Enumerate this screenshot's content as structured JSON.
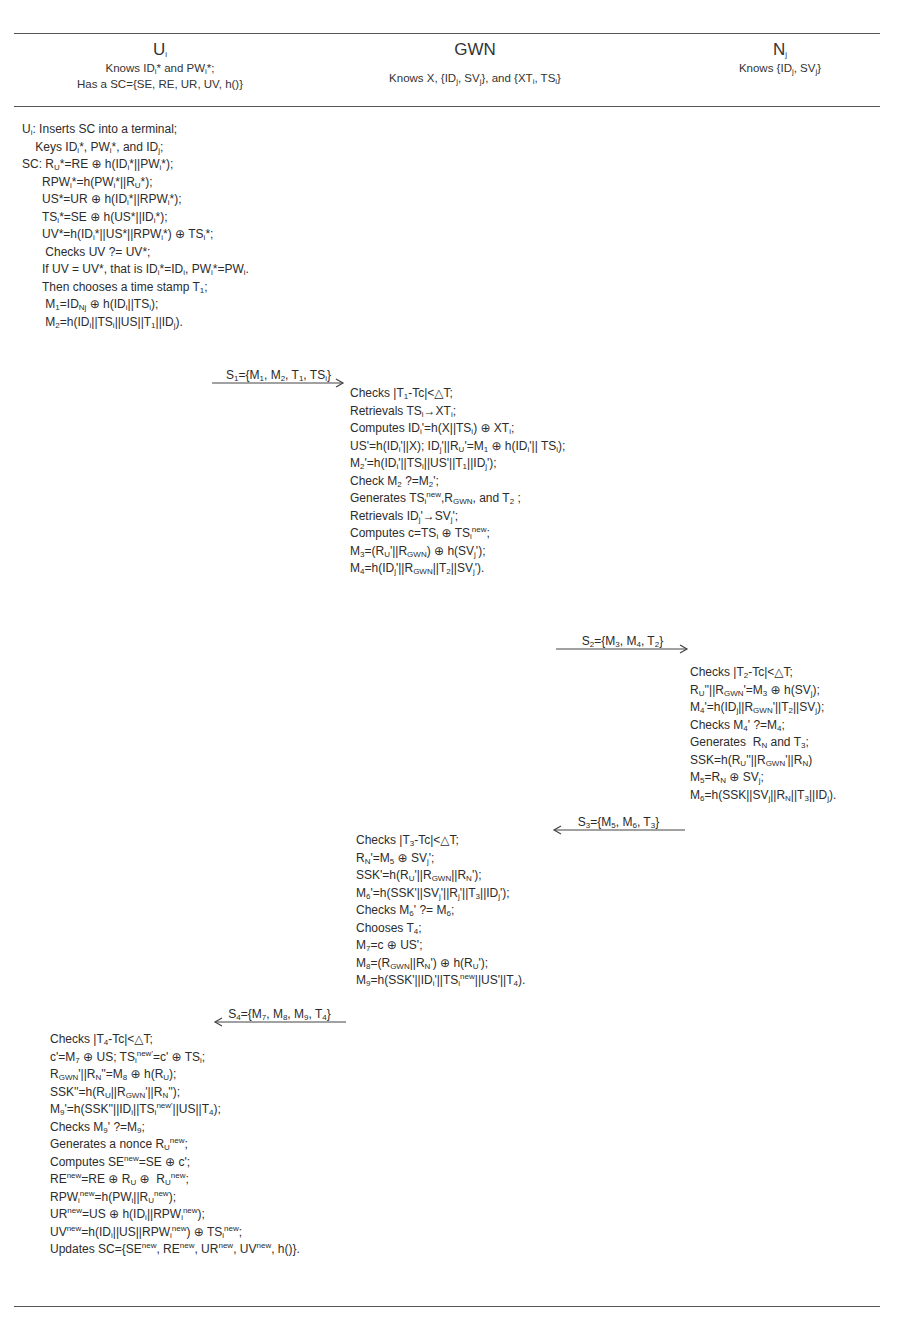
{
  "parties": {
    "user": {
      "name": "U",
      "name_sub": "i",
      "knows_html": "Knows ID<sub>i</sub>* and PW<sub>i</sub>*;",
      "has_html": "Has a SC={SE, RE, UR, UV, h()}"
    },
    "gwn": {
      "name": "GWN",
      "knows_html": "Knows X, {ID<sub>j</sub>, SV<sub>j</sub>}, and {XT<sub>i</sub>, TS<sub>i</sub>}"
    },
    "node": {
      "name": "N",
      "name_sub": "j",
      "knows_html": "Knows {ID<sub>j</sub>, SV<sub>j</sub>}"
    }
  },
  "user_login_steps": [
    "U<sub>i</sub>: Inserts SC into a terminal;",
    "&nbsp;&nbsp;&nbsp;&nbsp;Keys ID<sub>i</sub>*, PW<sub>i</sub>*, and ID<sub>j</sub>;",
    "SC: R<sub>U</sub>*=RE &#8853; h(ID<sub>i</sub>*||PW<sub>i</sub>*);",
    "&nbsp;&nbsp;&nbsp;&nbsp;&nbsp;&nbsp;RPW<sub>i</sub>*=h(PW<sub>i</sub>*||R<sub>U</sub>*);",
    "&nbsp;&nbsp;&nbsp;&nbsp;&nbsp;&nbsp;US*=UR &#8853; h(ID<sub>i</sub>*||RPW<sub>i</sub>*);",
    "&nbsp;&nbsp;&nbsp;&nbsp;&nbsp;&nbsp;TS<sub>i</sub>*=SE &#8853; h(US*||ID<sub>i</sub>*);",
    "&nbsp;&nbsp;&nbsp;&nbsp;&nbsp;&nbsp;UV*=h(ID<sub>i</sub>*||US*||RPW<sub>i</sub>*) &#8853; TS<sub>i</sub>*;",
    "&nbsp;&nbsp;&nbsp;&nbsp;&nbsp;&nbsp;&nbsp;Checks UV ?= UV*;",
    "&nbsp;&nbsp;&nbsp;&nbsp;&nbsp;&nbsp;If UV = UV*, that is ID<sub>i</sub>*=ID<sub>i</sub>, PW<sub>i</sub>*=PW<sub>i</sub>.",
    "&nbsp;&nbsp;&nbsp;&nbsp;&nbsp;&nbsp;Then chooses a time stamp T<sub>1</sub>;",
    "&nbsp;&nbsp;&nbsp;&nbsp;&nbsp;&nbsp;&nbsp;M<sub>1</sub>=ID<sub>Nj</sub> &#8853; h(ID<sub>i</sub>||TS<sub>i</sub>);",
    "&nbsp;&nbsp;&nbsp;&nbsp;&nbsp;&nbsp;&nbsp;M<sub>2</sub>=h(ID<sub>i</sub>||TS<sub>i</sub>||US||T<sub>1</sub>||ID<sub>j</sub>)."
  ],
  "messages": {
    "s1": {
      "label_html": "S<sub>1</sub>={M<sub>1</sub>, M<sub>2</sub>, T<sub>1</sub>, TS<sub>i</sub>}",
      "direction": "right"
    },
    "s2": {
      "label_html": "S<sub>2</sub>={M<sub>3</sub>, M<sub>4</sub>, T<sub>2</sub>}",
      "direction": "right"
    },
    "s3": {
      "label_html": "S<sub>3</sub>={M<sub>5</sub>, M<sub>6</sub>, T<sub>3</sub>}",
      "direction": "left"
    },
    "s4": {
      "label_html": "S<sub>4</sub>={M<sub>7</sub>, M<sub>8</sub>, M<sub>9</sub>, T<sub>4</sub>}",
      "direction": "left"
    }
  },
  "gwn_steps_1": [
    "Checks |T<sub>1</sub>-Tc|&lt;&#9651;T;",
    "Retrievals TS<sub>i</sub>&#8594;XT<sub>i</sub>;",
    "Computes ID<sub>i</sub>'=h(X||TS<sub>i</sub>) &#8853; XT<sub>i</sub>;",
    "US'=h(ID<sub>i</sub>'||X); ID<sub>j</sub>'||R<sub>U</sub>'=M<sub>1</sub> &#8853; h(ID<sub>i</sub>'|| TS<sub>i</sub>);",
    "M<sub>2</sub>'=h(ID<sub>i</sub>'||TS<sub>i</sub>||US'||T<sub>1</sub>||ID<sub>j</sub>');",
    "Check M<sub>2</sub> ?=M<sub>2</sub>';",
    "Generates TS<sub>i</sub><sup>new</sup>,R<sub>GWN</sub>, and T<sub>2</sub> ;",
    "Retrievals ID<sub>j</sub>'&#8594;SV<sub>j</sub>';",
    "Computes c=TS<sub>i</sub> &#8853; TS<sub>i</sub><sup>new</sup>;",
    "M<sub>3</sub>=(R<sub>U</sub>'||R<sub>GWN</sub>) &#8853; h(SV<sub>j</sub>');",
    "M<sub>4</sub>=h(ID<sub>j</sub>'||R<sub>GWN</sub>||T<sub>2</sub>||SV<sub>j</sub>')."
  ],
  "node_steps": [
    "Checks |T<sub>2</sub>-Tc|&lt;&#9651;T;",
    "R<sub>U</sub>''||R<sub>GWN</sub>'=M<sub>3</sub> &#8853; h(SV<sub>j</sub>);",
    "M<sub>4</sub>'=h(ID<sub>j</sub>||R<sub>GWN</sub>'||T<sub>2</sub>||SV<sub>j</sub>);",
    "Checks M<sub>4</sub>' ?=M<sub>4</sub>;",
    "Generates&nbsp; R<sub>N</sub> and T<sub>3</sub>;",
    "SSK=h(R<sub>U</sub>''||R<sub>GWN</sub>'||R<sub>N</sub>)",
    "M<sub>5</sub>=R<sub>N</sub> &#8853; SV<sub>j</sub>;",
    "M<sub>6</sub>=h(SSK||SV<sub>j</sub>||R<sub>N</sub>||T<sub>3</sub>||ID<sub>j</sub>)."
  ],
  "gwn_steps_2": [
    "Checks |T<sub>3</sub>-Tc|&lt;&#9651;T;",
    "R<sub>N</sub>'=M<sub>5</sub> &#8853; SV<sub>j</sub>';",
    "SSK'=h(R<sub>U</sub>'||R<sub>GWN</sub>||R<sub>N</sub>');",
    "M<sub>6</sub>'=h(SSK'||SV<sub>j</sub>'||R<sub>j</sub>'||T<sub>3</sub>||ID<sub>j</sub>');",
    "Checks M<sub>6</sub>' ?= M<sub>6</sub>;",
    "Chooses T<sub>4</sub>;",
    "M<sub>7</sub>=c &#8853; US';",
    "M<sub>8</sub>=(R<sub>GWN</sub>||R<sub>N</sub>') &#8853; h(R<sub>U</sub>');",
    "M<sub>9</sub>=h(SSK'||ID<sub>i</sub>'||TS<sub>i</sub><sup>new</sup>||US'||T<sub>4</sub>)."
  ],
  "user_final_steps": [
    "Checks |T<sub>4</sub>-Tc|&lt;&#9651;T;",
    "c'=M<sub>7</sub> &#8853; US; TS<sub>i</sub><sup>new'</sup>=c' &#8853; TS<sub>i</sub>;",
    "R<sub>GWN</sub>'||R<sub>N</sub>''=M<sub>8</sub> &#8853; h(R<sub>U</sub>);",
    "SSK''=h(R<sub>U</sub>||R<sub>GWN</sub>'||R<sub>N</sub>'');",
    "M<sub>9</sub>'=h(SSK''||ID<sub>i</sub>||TS<sub>i</sub><sup>new'</sup>||US||T<sub>4</sub>);",
    "Checks M<sub>9</sub>' ?=M<sub>9</sub>;",
    "Generates a nonce R<sub>U</sub><sup>new</sup>;",
    "Computes SE<sup>new</sup>=SE &#8853; c';",
    "RE<sup>new</sup>=RE &#8853; R<sub>U</sub> &#8853;&nbsp; R<sub>U</sub><sup>new</sup>;",
    "RPW<sub>i</sub><sup>new</sup>=h(PW<sub>i</sub>||R<sub>U</sub><sup>new</sup>);",
    "UR<sup>new</sup>=US &#8853; h(ID<sub>i</sub>||RPW<sub>i</sub><sup>new</sup>);",
    "UV<sup>new</sup>=h(ID<sub>i</sub>||US||RPW<sub>i</sub><sup>new</sup>) &#8853; TS<sub>i</sub><sup>new</sup>;",
    "Updates SC={SE<sup>new</sup>, RE<sup>new</sup>, UR<sup>new</sup>, UV<sup>new</sup>, h()}."
  ],
  "colors": {
    "text": "#2c2c2c",
    "rule": "#555555",
    "background": "#ffffff"
  }
}
